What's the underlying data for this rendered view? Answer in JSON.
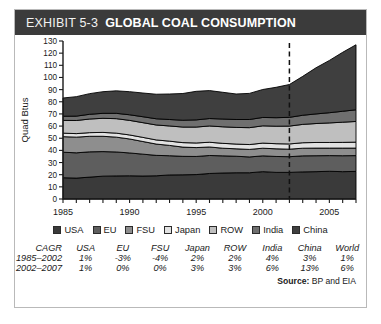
{
  "header": {
    "exhibit_number": "EXHIBIT 5-3",
    "title": "GLOBAL COAL CONSUMPTION"
  },
  "source": {
    "label": "Source:",
    "text": "BP and EIA"
  },
  "legend": [
    {
      "label": "USA",
      "color": "#3a3a3a"
    },
    {
      "label": "EU",
      "color": "#5e5e5e"
    },
    {
      "label": "FSU",
      "color": "#8e8e8e"
    },
    {
      "label": "Japan",
      "color": "#e2e2e2"
    },
    {
      "label": "ROW",
      "color": "#bfbfbf"
    },
    {
      "label": "India",
      "color": "#6f6f6f"
    },
    {
      "label": "China",
      "color": "#3f3f3f"
    }
  ],
  "cagr_table": {
    "corner": "CAGR",
    "columns": [
      "USA",
      "EU",
      "FSU",
      "Japan",
      "ROW",
      "India",
      "China",
      "World"
    ],
    "rows": [
      {
        "period": "1985–2002",
        "values": [
          "1%",
          "-3%",
          "-4%",
          "2%",
          "2%",
          "4%",
          "3%",
          "1%"
        ]
      },
      {
        "period": "2002–2007",
        "values": [
          "1%",
          "0%",
          "0%",
          "3%",
          "3%",
          "6%",
          "13%",
          "6%"
        ]
      }
    ]
  },
  "chart_data": {
    "type": "area",
    "stacked": true,
    "title": "GLOBAL COAL CONSUMPTION",
    "xlabel": "",
    "ylabel": "Quad Btus",
    "xlim": [
      1985,
      2007
    ],
    "ylim": [
      0,
      130
    ],
    "ytick_step": 10,
    "yticks": [
      0,
      10,
      20,
      30,
      40,
      50,
      60,
      70,
      80,
      90,
      100,
      110,
      120,
      130
    ],
    "xticks": [
      1985,
      1990,
      1995,
      2000,
      2005
    ],
    "xtick_labels": [
      "1985",
      "1990",
      "1995",
      "2000",
      "2005"
    ],
    "x_minor_step": 1,
    "grid": false,
    "legend_position": "below",
    "annotations": [
      {
        "type": "vline",
        "x": 2002,
        "style": "dashed",
        "label": ""
      }
    ],
    "x": [
      1985,
      1986,
      1987,
      1988,
      1989,
      1990,
      1991,
      1992,
      1993,
      1994,
      1995,
      1996,
      1997,
      1998,
      1999,
      2000,
      2001,
      2002,
      2003,
      2004,
      2005,
      2006,
      2007
    ],
    "series": [
      {
        "name": "USA",
        "color": "#3a3a3a",
        "values": [
          17.5,
          17.2,
          18.0,
          18.8,
          19.0,
          19.1,
          18.9,
          19.1,
          19.8,
          19.9,
          20.1,
          21.0,
          21.4,
          21.6,
          21.6,
          22.5,
          21.9,
          21.9,
          22.3,
          22.5,
          22.8,
          22.5,
          22.7
        ]
      },
      {
        "name": "EU",
        "color": "#5e5e5e",
        "values": [
          21.0,
          20.8,
          20.8,
          20.2,
          19.7,
          18.8,
          18.0,
          16.8,
          15.8,
          15.2,
          14.9,
          14.8,
          14.1,
          13.6,
          13.0,
          13.0,
          13.1,
          12.9,
          13.2,
          13.1,
          12.9,
          13.1,
          13.0
        ]
      },
      {
        "name": "FSU",
        "color": "#8e8e8e",
        "values": [
          12.8,
          12.9,
          12.8,
          12.6,
          12.2,
          11.5,
          10.4,
          9.3,
          8.5,
          7.6,
          7.3,
          7.0,
          6.3,
          6.1,
          6.2,
          6.3,
          6.3,
          6.2,
          6.3,
          6.3,
          6.2,
          6.3,
          6.2
        ]
      },
      {
        "name": "Japan",
        "color": "#e2e2e2",
        "values": [
          2.9,
          2.9,
          3.0,
          3.2,
          3.3,
          3.3,
          3.4,
          3.4,
          3.5,
          3.7,
          3.8,
          3.9,
          4.0,
          3.9,
          4.0,
          4.2,
          4.2,
          4.3,
          4.5,
          4.6,
          4.6,
          4.7,
          4.9
        ]
      },
      {
        "name": "ROW",
        "color": "#bfbfbf",
        "values": [
          10.5,
          10.8,
          11.2,
          11.6,
          11.9,
          12.0,
          12.1,
          12.3,
          12.5,
          12.8,
          13.1,
          13.4,
          13.6,
          13.7,
          13.9,
          14.2,
          14.4,
          14.7,
          15.1,
          15.6,
          16.1,
          16.6,
          17.0
        ]
      },
      {
        "name": "India",
        "color": "#6f6f6f",
        "values": [
          3.4,
          3.6,
          3.9,
          4.1,
          4.4,
          4.6,
          4.9,
          5.1,
          5.3,
          5.6,
          5.9,
          6.1,
          6.4,
          6.5,
          6.7,
          6.9,
          7.0,
          7.2,
          7.5,
          7.9,
          8.4,
          9.0,
          9.6
        ]
      },
      {
        "name": "China",
        "color": "#3f3f3f",
        "values": [
          15.0,
          16.0,
          17.0,
          17.8,
          18.5,
          19.0,
          19.5,
          20.2,
          21.0,
          22.0,
          23.5,
          23.0,
          22.0,
          21.0,
          21.5,
          23.0,
          25.0,
          27.0,
          32.0,
          38.0,
          43.0,
          48.5,
          53.5
        ]
      }
    ]
  }
}
